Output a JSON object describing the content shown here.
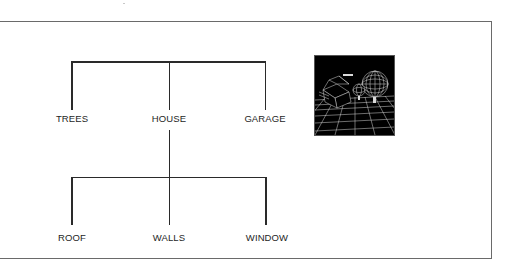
{
  "diagram": {
    "type": "tree-hierarchy",
    "level1": {
      "children": [
        {
          "label": "TREES"
        },
        {
          "label": "HOUSE"
        },
        {
          "label": "GARAGE"
        }
      ]
    },
    "level2": {
      "parent": "HOUSE",
      "children": [
        {
          "label": "ROOF"
        },
        {
          "label": "WALLS"
        },
        {
          "label": "WINDOW"
        }
      ]
    },
    "thumbnail": {
      "description": "wireframe 3D scene: house, spherical trees, perspective grid floor",
      "background": "#000000",
      "stroke": "#ffffff"
    },
    "colors": {
      "line": "#2a2a2a",
      "frame": "#6a6a6a",
      "text": "#1e1e1e"
    }
  }
}
